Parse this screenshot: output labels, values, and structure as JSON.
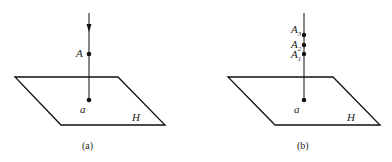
{
  "figures": [
    {
      "caption": "(a)",
      "plane_label": "H",
      "projection_label": "a",
      "points": [
        {
          "label": "A",
          "sub": ""
        }
      ],
      "has_arrow": true
    },
    {
      "caption": "(b)",
      "plane_label": "H",
      "projection_label": "a",
      "points": [
        {
          "label": "A",
          "sub": "3"
        },
        {
          "label": "A",
          "sub": "2"
        },
        {
          "label": "A",
          "sub": "1"
        }
      ],
      "has_arrow": false
    }
  ]
}
